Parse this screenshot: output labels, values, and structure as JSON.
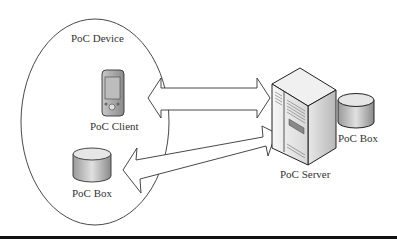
{
  "diagram": {
    "group_label": "PoC Device",
    "nodes": [
      {
        "id": "client",
        "label": "PoC Client",
        "icon": "mobile-device-icon"
      },
      {
        "id": "device-box",
        "label": "PoC Box",
        "icon": "database-cylinder-icon"
      },
      {
        "id": "server",
        "label": "PoC Server",
        "icon": "server-tower-icon"
      },
      {
        "id": "server-box",
        "label": "PoC Box",
        "icon": "database-cylinder-icon"
      }
    ],
    "edges": [
      {
        "from": "client",
        "to": "server",
        "type": "bidirectional"
      },
      {
        "from": "device-box",
        "to": "server",
        "type": "bidirectional"
      }
    ]
  }
}
